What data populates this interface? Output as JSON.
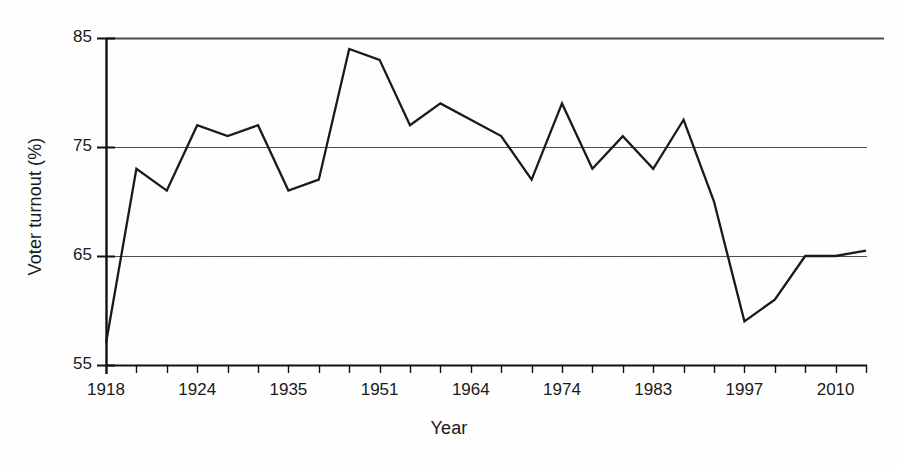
{
  "chart_data": {
    "type": "line",
    "title": "",
    "xlabel": "Year",
    "ylabel": "Voter turnout (%)",
    "ylim": [
      55,
      85
    ],
    "y_ticks": [
      55,
      65,
      75,
      85
    ],
    "grid": "horizontal",
    "legend": "none",
    "x_tick_labels": [
      "1918",
      "1924",
      "1935",
      "1951",
      "1964",
      "1974",
      "1983",
      "1997",
      "2010"
    ],
    "x_tick_label_indices": [
      0,
      3,
      6,
      9,
      12,
      15,
      18,
      21,
      24
    ],
    "n_ticks": 26,
    "categories": [
      "1918",
      "1922",
      "1923",
      "1924",
      "1929",
      "1931",
      "1935",
      "1945",
      "1950",
      "1951",
      "1955",
      "1959",
      "1964",
      "1966",
      "1970",
      "1974",
      "1974",
      "1979",
      "1983",
      "1987",
      "1992",
      "1997",
      "2001",
      "2005",
      "2010",
      "2015"
    ],
    "values": [
      57.0,
      73.0,
      71.0,
      77.0,
      76.0,
      77.0,
      71.0,
      72.0,
      84.0,
      83.0,
      77.0,
      79.0,
      77.5,
      76.0,
      72.0,
      79.0,
      73.0,
      76.0,
      73.0,
      77.5,
      70.0,
      59.0,
      61.0,
      65.0,
      65.0,
      65.0
    ],
    "series": [
      {
        "name": "Voter turnout",
        "color": "#1a1a1a",
        "points": [
          {
            "x": 0,
            "y": 57.0
          },
          {
            "x": 1,
            "y": 73.0
          },
          {
            "x": 2,
            "y": 71.0
          },
          {
            "x": 3,
            "y": 77.0
          },
          {
            "x": 4,
            "y": 76.0
          },
          {
            "x": 5,
            "y": 77.0
          },
          {
            "x": 6,
            "y": 71.0
          },
          {
            "x": 7,
            "y": 72.0
          },
          {
            "x": 8,
            "y": 84.0
          },
          {
            "x": 9,
            "y": 83.0
          },
          {
            "x": 10,
            "y": 77.0
          },
          {
            "x": 11,
            "y": 79.0
          },
          {
            "x": 12,
            "y": 77.5
          },
          {
            "x": 13,
            "y": 76.0
          },
          {
            "x": 14,
            "y": 72.0
          },
          {
            "x": 15,
            "y": 79.0
          },
          {
            "x": 16,
            "y": 73.0
          },
          {
            "x": 17,
            "y": 76.0
          },
          {
            "x": 18,
            "y": 73.0
          },
          {
            "x": 19,
            "y": 77.5
          },
          {
            "x": 20,
            "y": 70.0
          },
          {
            "x": 21,
            "y": 59.0
          },
          {
            "x": 22,
            "y": 61.0
          },
          {
            "x": 23,
            "y": 65.0
          },
          {
            "x": 24,
            "y": 65.0
          },
          {
            "x": 25,
            "y": 65.5
          }
        ]
      }
    ]
  },
  "axes": {
    "y_title": "Voter turnout (%)",
    "x_title": "Year",
    "y_labels": [
      "85",
      "75",
      "65",
      "55"
    ],
    "x_labels": [
      "1918",
      "1924",
      "1935",
      "1951",
      "1964",
      "1974",
      "1983",
      "1997",
      "2010"
    ]
  },
  "colors": {
    "line": "#1a1a1a",
    "grid": "#4d4d4d",
    "axis": "#111111",
    "background": "#fefefe",
    "text": "#1a1a1a"
  }
}
